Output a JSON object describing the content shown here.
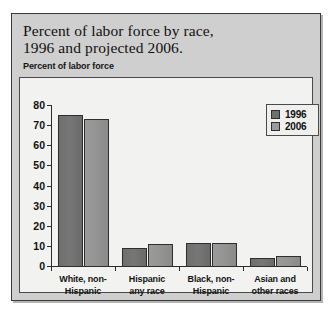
{
  "figure": {
    "title_line1": "Percent of labor force by race,",
    "title_line2": "1996 and projected 2006.",
    "subtitle": "Percent of labor force"
  },
  "legend": {
    "position": "top-right",
    "entries": [
      {
        "label": "1996",
        "color": "#6f6f6f"
      },
      {
        "label": "2006",
        "color": "#9a9a9a"
      }
    ]
  },
  "chart_data": {
    "type": "bar",
    "title": "Percent of labor force by race, 1996 and projected 2006.",
    "xlabel": "",
    "ylabel": "Percent of labor force",
    "ylim": [
      0,
      80
    ],
    "yticks": [
      0,
      10,
      20,
      30,
      40,
      50,
      60,
      70,
      80
    ],
    "ytick_labels": [
      "0",
      "10",
      "20",
      "30",
      "40",
      "50",
      "60",
      "70",
      "80"
    ],
    "grid": false,
    "legend_position": "top-right",
    "categories": [
      "White, non-Hispanic",
      "Hispanic any race",
      "Black, non-Hispanic",
      "Asian and other races"
    ],
    "category_label_lines": [
      [
        "White, non-",
        "Hispanic"
      ],
      [
        "Hispanic",
        "any race"
      ],
      [
        "Black, non-",
        "Hispanic"
      ],
      [
        "Asian and",
        "other races"
      ]
    ],
    "series": [
      {
        "name": "1996",
        "color": "#6f6f6f",
        "values": [
          75,
          9,
          11.5,
          4
        ]
      },
      {
        "name": "2006",
        "color": "#9a9a9a",
        "values": [
          73,
          11,
          11.5,
          5
        ]
      }
    ]
  }
}
